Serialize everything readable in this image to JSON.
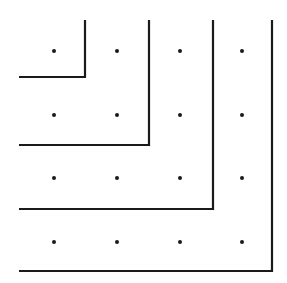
{
  "diagram": {
    "background": "#ffffff",
    "stroke_color": "#1a1a1a",
    "dot_color": "#1a1a1a",
    "grid_size": 4,
    "dot_columns_x": [
      54,
      117,
      180,
      242
    ],
    "dot_rows_y": [
      51,
      115,
      178,
      242
    ],
    "l_shapes": [
      {
        "corner_x": 85,
        "corner_y": 77
      },
      {
        "corner_x": 149,
        "corner_y": 145
      },
      {
        "corner_x": 213,
        "corner_y": 209
      },
      {
        "corner_x": 272,
        "corner_y": 271
      }
    ],
    "line_start_x": 19,
    "line_start_y": 20
  }
}
